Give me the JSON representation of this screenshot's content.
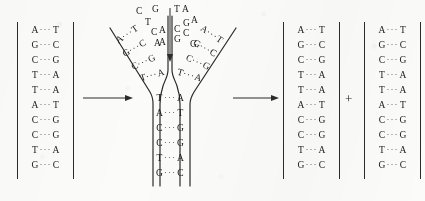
{
  "figure": {
    "background_color": "#fbfbfa",
    "ink_color": "#1a1a1a",
    "bond_symbol": "···",
    "plus_symbol": "+"
  },
  "parent_duplex": {
    "label": "parent-dna-duplex",
    "base_pairs": [
      {
        "left": "A",
        "bond": "···",
        "right": "T"
      },
      {
        "left": "G",
        "bond": "···",
        "right": "C"
      },
      {
        "left": "C",
        "bond": "···",
        "right": "G"
      },
      {
        "left": "T",
        "bond": "···",
        "right": "A"
      },
      {
        "left": "T",
        "bond": "···",
        "right": "A"
      },
      {
        "left": "A",
        "bond": "···",
        "right": "T"
      },
      {
        "left": "C",
        "bond": "···",
        "right": "G"
      },
      {
        "left": "C",
        "bond": "···",
        "right": "G"
      },
      {
        "left": "T",
        "bond": "···",
        "right": "A"
      },
      {
        "left": "G",
        "bond": "···",
        "right": "C"
      }
    ]
  },
  "replication_fork": {
    "label": "replication-fork",
    "unwound_left_template": [
      "C",
      "T",
      "C",
      "A"
    ],
    "unwound_right_template": [
      "T",
      "A",
      "C",
      "G"
    ],
    "incoming_left_bases": [
      "G",
      "A",
      "A"
    ],
    "incoming_right_bases": [
      "A",
      "G",
      "C",
      "G"
    ],
    "left_arm_pairs": [
      {
        "left": "A",
        "bond": "···",
        "right": "T"
      },
      {
        "left": "G",
        "bond": "···",
        "right": "C"
      },
      {
        "left": "C",
        "bond": "···",
        "right": "G"
      },
      {
        "left": "T",
        "bond": "···",
        "right": "A"
      }
    ],
    "right_arm_pairs": [
      {
        "left": "A",
        "bond": "···",
        "right": "T"
      },
      {
        "left": "G",
        "bond": "···",
        "right": "C"
      },
      {
        "left": "C",
        "bond": "···",
        "right": "G"
      },
      {
        "left": "T",
        "bond": "···",
        "right": "A"
      }
    ],
    "stem_pairs": [
      {
        "left": "T",
        "bond": "···",
        "right": "A"
      },
      {
        "left": "A",
        "bond": "···",
        "right": "T"
      },
      {
        "left": "C",
        "bond": "···",
        "right": "G"
      },
      {
        "left": "C",
        "bond": "···",
        "right": "G"
      },
      {
        "left": "T",
        "bond": "···",
        "right": "A"
      },
      {
        "left": "G",
        "bond": "···",
        "right": "C"
      }
    ]
  },
  "daughter_duplex_1": {
    "label": "daughter-dna-duplex-1",
    "base_pairs": [
      {
        "left": "A",
        "bond": "···",
        "right": "T"
      },
      {
        "left": "G",
        "bond": "···",
        "right": "C"
      },
      {
        "left": "C",
        "bond": "···",
        "right": "G"
      },
      {
        "left": "T",
        "bond": "···",
        "right": "A"
      },
      {
        "left": "T",
        "bond": "···",
        "right": "A"
      },
      {
        "left": "A",
        "bond": "···",
        "right": "T"
      },
      {
        "left": "C",
        "bond": "···",
        "right": "G"
      },
      {
        "left": "C",
        "bond": "···",
        "right": "G"
      },
      {
        "left": "T",
        "bond": "···",
        "right": "A"
      },
      {
        "left": "G",
        "bond": "···",
        "right": "C"
      }
    ]
  },
  "daughter_duplex_2": {
    "label": "daughter-dna-duplex-2",
    "base_pairs": [
      {
        "left": "A",
        "bond": "···",
        "right": "T"
      },
      {
        "left": "G",
        "bond": "···",
        "right": "C"
      },
      {
        "left": "C",
        "bond": "···",
        "right": "G"
      },
      {
        "left": "T",
        "bond": "···",
        "right": "A"
      },
      {
        "left": "T",
        "bond": "···",
        "right": "A"
      },
      {
        "left": "A",
        "bond": "···",
        "right": "T"
      },
      {
        "left": "C",
        "bond": "···",
        "right": "G"
      },
      {
        "left": "C",
        "bond": "···",
        "right": "G"
      },
      {
        "left": "T",
        "bond": "···",
        "right": "A"
      },
      {
        "left": "G",
        "bond": "···",
        "right": "C"
      }
    ]
  },
  "arrows": [
    {
      "name": "arrow-1",
      "direction": "right"
    },
    {
      "name": "arrow-2",
      "direction": "right"
    }
  ]
}
